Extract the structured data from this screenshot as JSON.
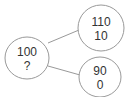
{
  "diagram": {
    "type": "tree",
    "colors": {
      "stroke": "#999999",
      "fill": "#ffffff",
      "text": "#333333"
    },
    "nodes": [
      {
        "id": "root",
        "line1": "100",
        "line2": "?",
        "cx": 27,
        "cy": 58,
        "r": 22
      },
      {
        "id": "child-top",
        "line1": "110",
        "line2": "10",
        "cx": 101,
        "cy": 28,
        "r": 23
      },
      {
        "id": "child-bottom",
        "line1": "90",
        "line2": "0",
        "cx": 100,
        "cy": 77,
        "r": 21
      }
    ],
    "edges": [
      {
        "from": "root",
        "to": "child-top"
      },
      {
        "from": "root",
        "to": "child-bottom"
      }
    ]
  }
}
